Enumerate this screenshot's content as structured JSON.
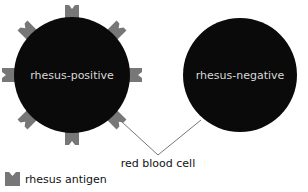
{
  "diagram": {
    "cells": [
      {
        "id": "positive",
        "label": "rhesus-positive",
        "cx": 72,
        "cy": 75,
        "r": 58,
        "has_antigens": true
      },
      {
        "id": "negative",
        "label": "rhesus-negative",
        "cx": 240,
        "cy": 75,
        "r": 57,
        "has_antigens": false
      }
    ],
    "antigen_angles_deg": [
      0,
      45,
      90,
      135,
      180,
      225,
      270,
      315
    ],
    "callout": {
      "label": "red blood cell"
    },
    "legend": {
      "label": "rhesus antigen",
      "icon": "rhesus-antigen-icon"
    },
    "colors": {
      "cell_fill": "#0a0a0a",
      "antigen_fill": "#777777",
      "cell_label": "#d8d8d8",
      "line": "#666666",
      "text": "#111111"
    }
  }
}
